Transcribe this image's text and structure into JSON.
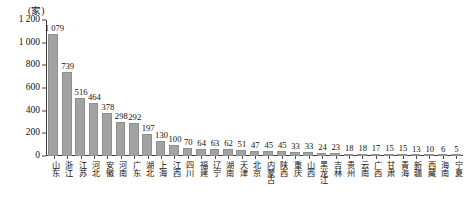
{
  "chart_data": {
    "type": "bar",
    "title": "",
    "subtitle": "",
    "unit_label": "(家)",
    "xlabel": "",
    "ylabel": "",
    "ylim": [
      0,
      1200
    ],
    "ytick_values": [
      0,
      200,
      400,
      600,
      800,
      1000,
      1200
    ],
    "ytick_labels": [
      "0",
      "200",
      "400",
      "600",
      "800",
      "1 000",
      "1 200"
    ],
    "grid": false,
    "legend": null,
    "categories": [
      "山东",
      "浙江",
      "江苏",
      "河北",
      "安徽",
      "河南",
      "广东",
      "湖北",
      "上海",
      "江西",
      "四川",
      "福建",
      "辽宁",
      "湖南",
      "天津",
      "北京",
      "内蒙古",
      "陕西",
      "重庆",
      "山西",
      "黑龙江",
      "吉林",
      "贵州",
      "云南",
      "广西",
      "甘肃",
      "青海",
      "新疆",
      "西藏",
      "海南",
      "宁夏"
    ],
    "values": [
      1079,
      739,
      516,
      464,
      378,
      298,
      292,
      197,
      130,
      100,
      70,
      64,
      63,
      62,
      51,
      47,
      45,
      45,
      33,
      33,
      24,
      23,
      18,
      18,
      17,
      15,
      15,
      13,
      10,
      6,
      5
    ],
    "value_labels": [
      "1 079",
      "739",
      "516",
      "464",
      "378",
      "298",
      "292",
      "197",
      "130",
      "100",
      "70",
      "64",
      "63",
      "62",
      "51",
      "47",
      "45",
      "45",
      "33",
      "33",
      "24",
      "23",
      "18",
      "18",
      "17",
      "15",
      "15",
      "13",
      "10",
      "6",
      "5"
    ],
    "bar_color": "#a3a3a3",
    "axis_color": "#3a3a3a",
    "background_color": "#ffffff"
  }
}
